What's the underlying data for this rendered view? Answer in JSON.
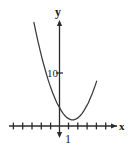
{
  "figure": {
    "background_color": "#ffffff",
    "ink_color": "#2b2b2b",
    "text_color": "#1a1a1a",
    "width": 132,
    "height": 157
  },
  "axes": {
    "x_axis_label": "x",
    "y_axis_label": "y",
    "x_axis_y_pixel": 126,
    "y_axis_x_pixel": 59,
    "x_tick_count": 12,
    "x_tick_spacing_px": 9.3,
    "arrow_directions": [
      "right",
      "up",
      "down"
    ]
  },
  "tick_labels": {
    "y_axis_value": "10",
    "x_axis_value": "1"
  },
  "chart_data": {
    "type": "line",
    "title": "",
    "subtitle": "",
    "xlabel": "x",
    "ylabel": "y",
    "curve_name": "parabola",
    "orientation": "opens-upward",
    "vertex": [
      1,
      0.6
    ],
    "y_intercept": 3.5,
    "xlim": [
      -6.3,
      7.8
    ],
    "ylim": [
      -1.5,
      17
    ],
    "grid": false,
    "legend": false,
    "x_ticks": [
      -6,
      -5,
      -4,
      -3,
      -2,
      -1,
      0,
      1,
      2,
      3,
      4,
      5
    ],
    "x_tick_labels": [
      "",
      "",
      "",
      "",
      "",
      "",
      "",
      "1",
      "",
      "",
      "",
      ""
    ],
    "y_ticks": [
      10
    ],
    "y_tick_labels": [
      "10"
    ],
    "x": [
      -3.0,
      -2.75,
      -2.5,
      -2.25,
      -2.0,
      -1.75,
      -1.5,
      -1.25,
      -1.0,
      -0.75,
      -0.5,
      -0.25,
      0.0,
      0.25,
      0.5,
      0.75,
      1.0,
      1.25,
      1.5,
      1.75,
      2.0,
      2.25,
      2.5,
      2.75,
      3.0,
      3.25,
      3.5,
      3.75,
      4.0,
      4.25,
      4.5
    ],
    "y": [
      16.6,
      15.0,
      13.5,
      12.1,
      10.7,
      9.5,
      8.3,
      7.2,
      6.2,
      5.3,
      4.5,
      3.7,
      3.1,
      2.5,
      2.0,
      1.6,
      1.3,
      1.1,
      1.0,
      1.0,
      1.1,
      1.3,
      1.6,
      2.0,
      2.5,
      3.1,
      3.7,
      4.5,
      5.3,
      6.2,
      7.2
    ]
  }
}
